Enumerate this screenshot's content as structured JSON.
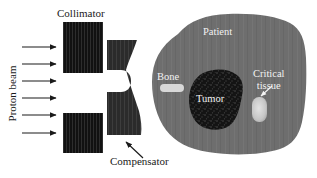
{
  "figure": {
    "labels": {
      "collimator": "Collimator",
      "compensator": "Compensator",
      "proton_beam": "Proton beam",
      "patient": "Patient",
      "bone": "Bone",
      "tumor": "Tumor",
      "critical_tissue_line1": "Critical",
      "critical_tissue_line2": "tissue"
    },
    "colors": {
      "background": "#ffffff",
      "collimator": "#111111",
      "compensator": "#2b2b2b",
      "patient": "#6e6e6e",
      "bone": "#d8d8d8",
      "tumor": "#141414",
      "critical_tissue": "#c9c9c9",
      "arrow_dark": "#1a1a1a",
      "arrow_light": "#f5f5f5",
      "text_dark": "#1a1a1a",
      "text_light": "#f2f2f2"
    },
    "beam_arrow_count": 6,
    "beam_arrow_y": [
      47,
      64,
      81,
      98,
      115,
      133
    ],
    "beam_arrow_x_start": 22,
    "beam_arrow_x_end": 58,
    "collimator_blocks": [
      {
        "name": "upper",
        "x": 63,
        "y": 22,
        "width": 40,
        "height": 51
      },
      {
        "name": "lower",
        "x": 63,
        "y": 113,
        "width": 40,
        "height": 40
      }
    ]
  }
}
